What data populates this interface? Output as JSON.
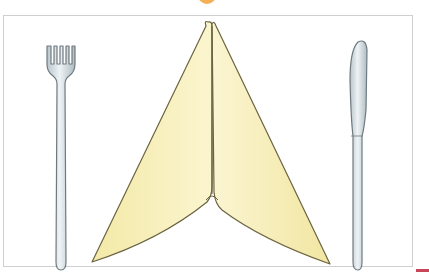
{
  "scene": {
    "description": "Place setting illustration: folded napkin standing upright between a fork and a knife",
    "objects": [
      "fork",
      "folded-napkin",
      "knife"
    ],
    "colors": {
      "napkin_fill": "#f7efb6",
      "napkin_outline": "#6b6440",
      "cutlery_fill": "#d9e2e6",
      "cutlery_outline": "#6f7a80",
      "frame_border": "#cfcfcf",
      "accent_top": "#f2a13a",
      "corner_accent": "#c8455a"
    }
  }
}
